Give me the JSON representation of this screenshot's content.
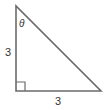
{
  "diagram": {
    "type": "right-triangle",
    "labels": {
      "left_side": "3",
      "bottom_side": "3",
      "angle": "θ"
    },
    "right_angle_marker": true,
    "stroke_color": "#6b6b6b",
    "label_color": "#333333"
  }
}
